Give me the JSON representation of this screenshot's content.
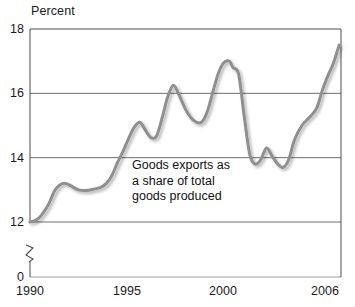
{
  "chart_data": {
    "type": "line",
    "title": "",
    "subtitle": "",
    "ylabel": "Percent",
    "xlabel": "",
    "ylim": [
      12,
      18
    ],
    "xlim": [
      1990,
      2006.7
    ],
    "y_ticks": [
      "18",
      "16",
      "14",
      "12",
      "0"
    ],
    "y_tick_values": [
      18,
      16,
      14,
      12,
      0
    ],
    "x_ticks": [
      "1990",
      "1995",
      "2000",
      "2006"
    ],
    "x_tick_values": [
      1990,
      1995,
      2000,
      2006
    ],
    "grid": "horizontal",
    "legend": "none",
    "axis_break": true,
    "axis_break_between": [
      0,
      12
    ],
    "annotations": [
      {
        "name": "series-annotation",
        "text": "Goods exports as\na share of total\ngoods produced",
        "x": 1995.3,
        "y": 13.5
      }
    ],
    "series": [
      {
        "name": "Goods exports as a share of total goods produced",
        "color": "#8f8f8f",
        "x": [
          1990.0,
          1990.3,
          1990.6,
          1991.0,
          1991.3,
          1991.6,
          1991.9,
          1992.2,
          1992.6,
          1993.0,
          1993.4,
          1993.8,
          1994.1,
          1994.4,
          1994.7,
          1995.0,
          1995.3,
          1995.6,
          1995.9,
          1996.2,
          1996.5,
          1996.8,
          1997.1,
          1997.4,
          1997.7,
          1998.0,
          1998.4,
          1998.8,
          1999.2,
          1999.5,
          1999.8,
          2000.1,
          2000.4,
          2000.7,
          2000.9,
          2001.2,
          2001.5,
          2001.8,
          2002.1,
          2002.4,
          2002.7,
          2003.0,
          2003.3,
          2003.6,
          2003.9,
          2004.2,
          2004.6,
          2005.0,
          2005.4,
          2005.7,
          2006.0,
          2006.3,
          2006.6
        ],
        "y": [
          12.0,
          12.05,
          12.2,
          12.55,
          12.95,
          13.15,
          13.2,
          13.12,
          13.0,
          12.98,
          13.02,
          13.08,
          13.2,
          13.45,
          13.85,
          14.2,
          14.6,
          14.95,
          15.1,
          14.85,
          14.62,
          14.68,
          15.25,
          15.9,
          16.25,
          15.95,
          15.45,
          15.15,
          15.1,
          15.4,
          16.0,
          16.6,
          16.95,
          17.0,
          16.8,
          16.6,
          15.3,
          14.1,
          13.8,
          13.95,
          14.3,
          14.05,
          13.8,
          13.7,
          13.95,
          14.55,
          15.0,
          15.25,
          15.55,
          16.1,
          16.55,
          16.95,
          17.5
        ]
      }
    ]
  },
  "axis_break_icon": "axis-break-zigzag"
}
